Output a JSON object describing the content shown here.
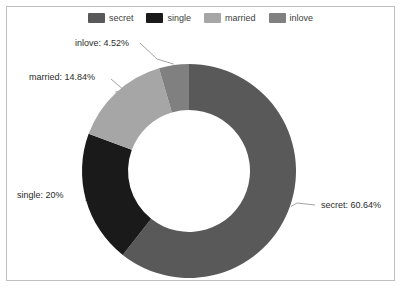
{
  "chart_data": {
    "type": "pie",
    "variant": "donut",
    "title": "",
    "xlabel": "",
    "ylabel": "",
    "categories": [
      "secret",
      "single",
      "married",
      "inlove"
    ],
    "values": [
      60.64,
      20,
      14.84,
      4.52
    ],
    "value_unit": "%",
    "data_labels": [
      "secret: 60.64%",
      "single: 20%",
      "married: 14.84%",
      "inlove: 4.52%"
    ],
    "colors": [
      "#595959",
      "#1a1a1a",
      "#a6a6a6",
      "#808080"
    ],
    "start_angle_deg": 0,
    "direction": "clockwise",
    "hole_ratio": 0.57,
    "grid": false,
    "legend": {
      "position": "top",
      "entries": [
        {
          "label": "secret",
          "color": "#595959"
        },
        {
          "label": "single",
          "color": "#1a1a1a"
        },
        {
          "label": "married",
          "color": "#a6a6a6"
        },
        {
          "label": "inlove",
          "color": "#808080"
        }
      ]
    },
    "labels": {
      "secret": "secret: 60.64%",
      "single": "single: 20%",
      "married": "married: 14.84%",
      "inlove": "inlove: 4.52%"
    }
  },
  "card": {
    "border_color": "#bfbfbf",
    "background": "#ffffff"
  }
}
